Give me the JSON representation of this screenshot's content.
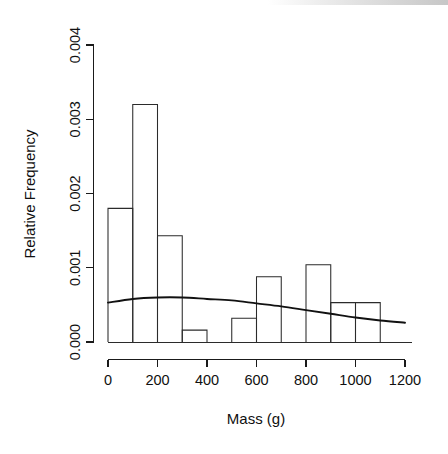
{
  "chart_data": {
    "type": "bar",
    "title": "",
    "subtitle": "",
    "xlabel": "Mass (g)",
    "ylabel": "Relative Frequency",
    "xlim": [
      0,
      1200
    ],
    "ylim": [
      0,
      0.004
    ],
    "grid": false,
    "legend": null,
    "bin_width": 100,
    "x_ticks": [
      0,
      200,
      400,
      600,
      800,
      1000,
      1200
    ],
    "x_tick_labels": [
      "0",
      "200",
      "400",
      "600",
      "800",
      "1000",
      "1200"
    ],
    "y_ticks": [
      0.0,
      0.001,
      0.002,
      0.003,
      0.004
    ],
    "y_tick_labels": [
      "0.000",
      "0.001",
      "0.002",
      "0.003",
      "0.004"
    ],
    "bin_edges": [
      0,
      100,
      200,
      300,
      400,
      500,
      600,
      700,
      800,
      900,
      1000,
      1100,
      1200
    ],
    "categories": [
      "0-100",
      "100-200",
      "200-300",
      "300-400",
      "400-500",
      "500-600",
      "600-700",
      "700-800",
      "800-900",
      "900-1000",
      "1000-1100",
      "1100-1200"
    ],
    "values": [
      0.0018,
      0.0032,
      0.00143,
      0.00016,
      0.0,
      0.00032,
      0.00088,
      0.0,
      0.00104,
      0.00053,
      0.00053,
      0.0
    ],
    "series": [
      {
        "name": "Relative Frequency",
        "type": "bar",
        "categories": [
          "0-100",
          "100-200",
          "200-300",
          "300-400",
          "400-500",
          "500-600",
          "600-700",
          "700-800",
          "800-900",
          "900-1000",
          "1000-1100",
          "1100-1200"
        ],
        "values": [
          0.0018,
          0.0032,
          0.00143,
          0.00016,
          0.0,
          0.00032,
          0.00088,
          0.0,
          0.00104,
          0.00053,
          0.00053,
          0.0
        ]
      },
      {
        "name": "Fitted density curve",
        "type": "line",
        "x": [
          0,
          100,
          200,
          300,
          400,
          500,
          600,
          700,
          800,
          900,
          1000,
          1100,
          1200
        ],
        "y": [
          0.00053,
          0.00058,
          0.0006,
          0.0006,
          0.00058,
          0.00056,
          0.00052,
          0.00048,
          0.00043,
          0.00038,
          0.00033,
          0.00029,
          0.00026
        ]
      }
    ],
    "annotations": []
  },
  "axes": {
    "y_axis_title": "Relative Frequency",
    "x_axis_title": "Mass (g)"
  },
  "colors": {
    "background": "#ffffff",
    "foreground": "#101010",
    "bar_stroke": "#2b2b2b",
    "bar_fill": "none",
    "curve": "#111111"
  }
}
